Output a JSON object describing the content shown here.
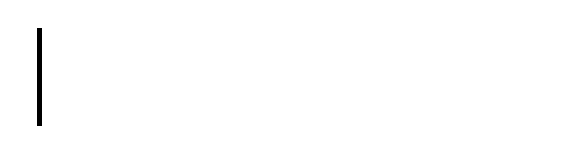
{
  "fret_label": "Fret:",
  "frets": [
    {
      "number": "1",
      "label_x": 62
    },
    {
      "number": "2",
      "label_x": 108
    },
    {
      "number": "3",
      "label_x": 152
    },
    {
      "number": "4",
      "label_x": 193
    },
    {
      "number": "5",
      "label_x": 233
    },
    {
      "number": "6",
      "label_x": 270
    },
    {
      "number": "7",
      "label_x": 306
    },
    {
      "number": "8",
      "label_x": 340
    },
    {
      "number": "9",
      "label_x": 372
    },
    {
      "number": "10",
      "label_x": 401
    },
    {
      "number": "11",
      "label_x": 431
    },
    {
      "number": "12",
      "label_x": 458
    },
    {
      "number": "13",
      "label_x": 484
    },
    {
      "number": "14",
      "label_x": 509
    },
    {
      "number": "15",
      "label_x": 533
    }
  ],
  "fret_lines_x": [
    87,
    131,
    174,
    214,
    252,
    289,
    324,
    356,
    388,
    417,
    445,
    472,
    497,
    522,
    545
  ],
  "strings_y": [
    29,
    61,
    93,
    125
  ],
  "notes": [
    {
      "name": "F",
      "fret": 8,
      "string": 3,
      "x": 341,
      "y": 93
    },
    {
      "name": "G",
      "fret": 10,
      "string": 3,
      "x": 402,
      "y": 93
    }
  ],
  "interval": {
    "label": "WS",
    "from_x": 339,
    "to_x": 404
  }
}
